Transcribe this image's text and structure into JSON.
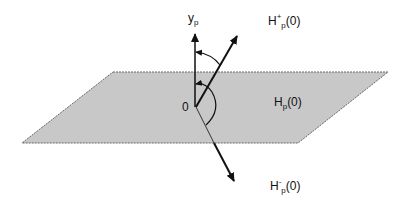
{
  "diagram": {
    "plane": {
      "label_base": "H",
      "label_sub": "p",
      "label_arg": "(0)",
      "fill": "#c8c8c8",
      "stroke": "#777777"
    },
    "axis": {
      "label_base": "y",
      "label_sub": "p"
    },
    "origin_label": "0",
    "upper_halfspace": {
      "label_base": "H",
      "label_sup": "+",
      "label_sub": "p",
      "label_arg": "(0)"
    },
    "lower_halfspace": {
      "label_base": "H",
      "label_sup": "-",
      "label_sub": "p",
      "label_arg": "(0)"
    }
  }
}
